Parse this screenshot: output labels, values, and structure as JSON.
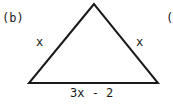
{
  "figure": {
    "part_label": "(b)",
    "next_part_label_fragment": "(",
    "shape": "isosceles-triangle",
    "sides": {
      "left": "x",
      "right": "x",
      "base": "3x - 2"
    },
    "vertices": {
      "apex": [
        94,
        4
      ],
      "bottom_left": [
        29,
        83
      ],
      "bottom_right": [
        158,
        83
      ]
    },
    "stroke_color": "#1a1a1a"
  }
}
